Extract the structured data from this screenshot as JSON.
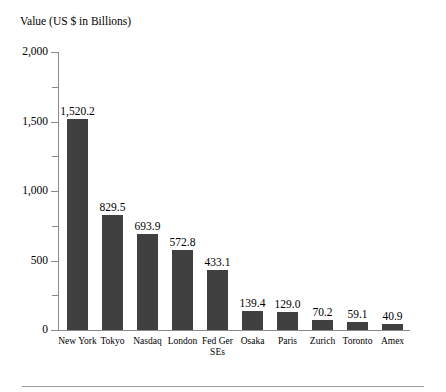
{
  "chart_data": {
    "type": "bar",
    "title": "Value (US $ in Billions)",
    "xlabel": "",
    "ylabel": "Value (US $ in Billions)",
    "ylim": [
      0,
      2000
    ],
    "grid": false,
    "legend": false,
    "bar_color": "#404040",
    "axis_color": "#8a8a8a",
    "y_major_ticks": [
      0,
      500,
      1000,
      1500,
      2000
    ],
    "y_major_tick_labels": [
      "0",
      "500",
      "1,000",
      "1,500",
      "2,000"
    ],
    "y_minor_ticks": [
      250,
      750,
      1250,
      1750
    ],
    "categories": [
      "New York",
      "Tokyo",
      "Nasdaq",
      "London",
      "Fed Ger SEs",
      "Osaka",
      "Paris",
      "Zurich",
      "Toronto",
      "Amex"
    ],
    "category_lines": [
      [
        "New York"
      ],
      [
        "Tokyo"
      ],
      [
        "Nasdaq"
      ],
      [
        "London"
      ],
      [
        "Fed Ger",
        "SEs"
      ],
      [
        "Osaka"
      ],
      [
        "Paris"
      ],
      [
        "Zurich"
      ],
      [
        "Toronto"
      ],
      [
        "Amex"
      ]
    ],
    "values": [
      1520.2,
      829.5,
      693.9,
      572.8,
      433.1,
      139.4,
      129.0,
      70.2,
      59.1,
      40.9
    ],
    "value_labels": [
      "1,520.2",
      "829.5",
      "693.9",
      "572.8",
      "433.1",
      "139.4",
      "129.0",
      "70.2",
      "59.1",
      "40.9"
    ]
  }
}
